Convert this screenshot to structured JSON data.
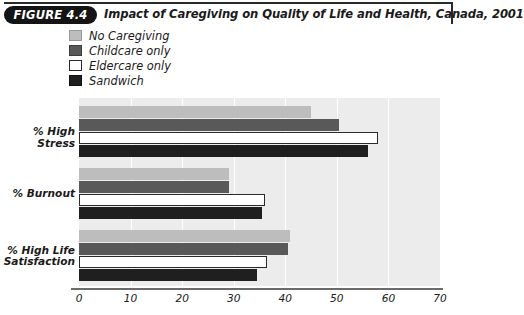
{
  "figure": {
    "badge": "FIGURE 4.4",
    "title": "Impact of Caregiving on Quality of Life and Health, Canada, 2001"
  },
  "legend": {
    "position": "top-left",
    "items": [
      {
        "label": "No Caregiving",
        "color": "#bdbdbd",
        "border": "#9a9a9a"
      },
      {
        "label": "Childcare only",
        "color": "#595959",
        "border": "#3d3d3d"
      },
      {
        "label": "Eldercare only",
        "color": "#ffffff",
        "border": "#2a2a2a"
      },
      {
        "label": "Sandwich",
        "color": "#1f1f1f",
        "border": "#111111"
      }
    ]
  },
  "chart_data": {
    "type": "bar",
    "orientation": "horizontal",
    "title": "Impact of Caregiving on Quality of Life and Health, Canada, 2001",
    "xlabel": "",
    "ylabel": "",
    "xlim": [
      0,
      70
    ],
    "xticks": [
      0,
      10,
      20,
      30,
      40,
      50,
      60,
      70
    ],
    "grid": true,
    "grid_axis": "x",
    "legend_position": "top-left",
    "categories": [
      "% High Stress",
      "% Burnout",
      "% High Life Satisfaction"
    ],
    "series": [
      {
        "name": "No Caregiving",
        "values": [
          45.0,
          29.0,
          41.0
        ]
      },
      {
        "name": "Childcare only",
        "values": [
          50.5,
          29.0,
          40.5
        ]
      },
      {
        "name": "Eldercare only",
        "values": [
          58.0,
          36.0,
          36.5
        ]
      },
      {
        "name": "Sandwich",
        "values": [
          56.0,
          35.5,
          34.5
        ]
      }
    ]
  },
  "category_labels": [
    {
      "line1": "% High Stress",
      "line2": ""
    },
    {
      "line1": "% Burnout",
      "line2": ""
    },
    {
      "line1": "% High Life",
      "line2": "Satisfaction"
    }
  ],
  "axis": {
    "tick_labels": [
      "0",
      "10",
      "20",
      "30",
      "40",
      "50",
      "60",
      "70"
    ]
  },
  "colors": {
    "plot_background": "#ececec",
    "gridline": "#ffffff",
    "axis_line": "#6b6b6b",
    "text": "#1a1a1a",
    "badge_background": "#141414",
    "badge_text": "#ffffff"
  }
}
